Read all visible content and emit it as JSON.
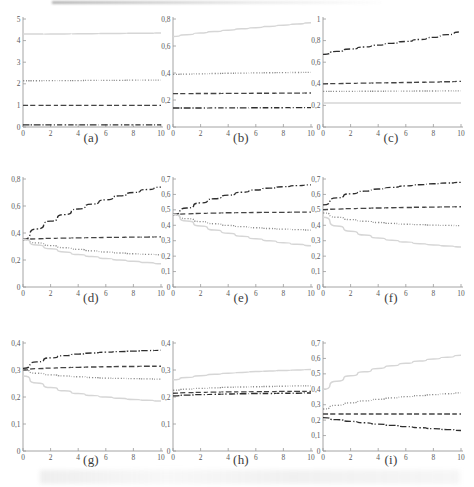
{
  "figure": {
    "title": "",
    "panel_count": 9,
    "layout": "3x3 grid of line plots",
    "decimal_separator": "comma"
  },
  "line_styles": {
    "solid": {
      "name": "solid",
      "color": "#d6d6d6",
      "dash": "none"
    },
    "dotted": {
      "name": "dotted",
      "color": "#8c8c8c",
      "dash": "1,1.6"
    },
    "dashed": {
      "name": "dashed",
      "color": "#444444",
      "dash": "5,2.6"
    },
    "dashdot": {
      "name": "dash-dot",
      "color": "#2e2e2e",
      "dash": "6,2,1.2,2"
    }
  },
  "chart_data": [
    {
      "type": "line",
      "panel": "(a)",
      "title": "",
      "xlabel": "",
      "ylabel": "",
      "xlim": [
        0,
        10
      ],
      "ylim": [
        0,
        5
      ],
      "xticks": [
        0,
        2,
        4,
        6,
        8,
        10
      ],
      "xticklabels": [
        "0",
        "2",
        "4",
        "6",
        "8",
        "10"
      ],
      "yticks": [
        0,
        1,
        2,
        3,
        4,
        5
      ],
      "yticklabels": [
        "0",
        "1",
        "2",
        "3",
        "4",
        "5"
      ],
      "grid": false,
      "legend": "none",
      "x": [
        0,
        1,
        2,
        3,
        4,
        5,
        6,
        7,
        8,
        9,
        10
      ],
      "series": [
        {
          "name": "solid",
          "style": "solid",
          "values": [
            4.3,
            4.3,
            4.31,
            4.31,
            4.32,
            4.32,
            4.33,
            4.33,
            4.34,
            4.34,
            4.35
          ]
        },
        {
          "name": "dotted",
          "style": "dotted",
          "values": [
            2.14,
            2.14,
            2.15,
            2.15,
            2.15,
            2.16,
            2.16,
            2.16,
            2.17,
            2.17,
            2.17
          ]
        },
        {
          "name": "dashed",
          "style": "dashed",
          "values": [
            1.0,
            1.0,
            1.0,
            1.0,
            1.0,
            1.0,
            1.0,
            1.0,
            1.0,
            1.0,
            1.0
          ]
        },
        {
          "name": "dashdot",
          "style": "dashdot",
          "values": [
            0.1,
            0.1,
            0.1,
            0.1,
            0.1,
            0.1,
            0.1,
            0.1,
            0.1,
            0.1,
            0.1
          ]
        }
      ]
    },
    {
      "type": "line",
      "panel": "(b)",
      "title": "",
      "xlabel": "",
      "ylabel": "",
      "xlim": [
        0,
        10
      ],
      "ylim": [
        0,
        0.8
      ],
      "xticks": [
        0,
        2,
        4,
        6,
        8,
        10
      ],
      "xticklabels": [
        "0",
        "2",
        "4",
        "6",
        "8",
        "10"
      ],
      "yticks": [
        0,
        0.2,
        0.4,
        0.6,
        0.8
      ],
      "yticklabels": [
        "0",
        "0,2",
        "0,4",
        "0,6",
        "0,8"
      ],
      "grid": false,
      "legend": "none",
      "x": [
        0,
        1,
        2,
        3,
        4,
        5,
        6,
        7,
        8,
        9,
        10
      ],
      "series": [
        {
          "name": "solid",
          "style": "solid",
          "values": [
            0.67,
            0.684,
            0.696,
            0.707,
            0.717,
            0.727,
            0.736,
            0.745,
            0.754,
            0.763,
            0.772
          ]
        },
        {
          "name": "dotted",
          "style": "dotted",
          "values": [
            0.39,
            0.392,
            0.394,
            0.396,
            0.398,
            0.399,
            0.401,
            0.402,
            0.403,
            0.404,
            0.405
          ]
        },
        {
          "name": "dashed",
          "style": "dashed",
          "values": [
            0.247,
            0.247,
            0.248,
            0.248,
            0.249,
            0.249,
            0.25,
            0.25,
            0.251,
            0.251,
            0.252
          ]
        },
        {
          "name": "dashdot",
          "style": "dashdot",
          "values": [
            0.141,
            0.141,
            0.141,
            0.142,
            0.142,
            0.142,
            0.143,
            0.143,
            0.143,
            0.144,
            0.144
          ]
        }
      ]
    },
    {
      "type": "line",
      "panel": "(c)",
      "title": "",
      "xlabel": "",
      "ylabel": "",
      "xlim": [
        0,
        10
      ],
      "ylim": [
        0,
        1
      ],
      "xticks": [
        0,
        2,
        4,
        6,
        8,
        10
      ],
      "xticklabels": [
        "0",
        "2",
        "4",
        "6",
        "8",
        "10"
      ],
      "yticks": [
        0,
        0.2,
        0.4,
        0.6,
        0.8,
        1
      ],
      "yticklabels": [
        "0",
        "0,2",
        "0,4",
        "0,6",
        "0,8",
        "1"
      ],
      "grid": false,
      "legend": "none",
      "x": [
        0,
        1,
        2,
        3,
        4,
        5,
        6,
        7,
        8,
        9,
        10
      ],
      "series": [
        {
          "name": "dashdot",
          "style": "dashdot",
          "values": [
            0.672,
            0.7,
            0.722,
            0.741,
            0.758,
            0.775,
            0.792,
            0.81,
            0.83,
            0.855,
            0.88
          ]
        },
        {
          "name": "dashed",
          "style": "dashed",
          "values": [
            0.4,
            0.402,
            0.404,
            0.406,
            0.408,
            0.41,
            0.412,
            0.414,
            0.416,
            0.419,
            0.422
          ]
        },
        {
          "name": "dotted",
          "style": "dotted",
          "values": [
            0.33,
            0.33,
            0.33,
            0.331,
            0.331,
            0.332,
            0.332,
            0.333,
            0.333,
            0.334,
            0.335
          ]
        },
        {
          "name": "solid",
          "style": "solid",
          "values": [
            0.222,
            0.222,
            0.222,
            0.222,
            0.222,
            0.222,
            0.222,
            0.222,
            0.222,
            0.222,
            0.222
          ]
        }
      ]
    },
    {
      "type": "line",
      "panel": "(d)",
      "title": "",
      "xlabel": "",
      "ylabel": "",
      "xlim": [
        0,
        10
      ],
      "ylim": [
        0,
        0.8
      ],
      "xticks": [
        0,
        2,
        4,
        6,
        8,
        10
      ],
      "xticklabels": [
        "0",
        "2",
        "4",
        "6",
        "8",
        "10"
      ],
      "yticks": [
        0,
        0.2,
        0.4,
        0.6,
        0.8
      ],
      "yticklabels": [
        "0",
        "0,2",
        "0,4",
        "0,6",
        "0,8"
      ],
      "grid": false,
      "legend": "none",
      "x": [
        0,
        1,
        2,
        3,
        4,
        5,
        6,
        7,
        8,
        9,
        10
      ],
      "series": [
        {
          "name": "dashdot",
          "style": "dashdot",
          "values": [
            0.352,
            0.43,
            0.488,
            0.536,
            0.578,
            0.614,
            0.646,
            0.675,
            0.7,
            0.722,
            0.74
          ]
        },
        {
          "name": "dashed",
          "style": "dashed",
          "values": [
            0.352,
            0.357,
            0.36,
            0.362,
            0.364,
            0.366,
            0.367,
            0.368,
            0.369,
            0.37,
            0.371
          ]
        },
        {
          "name": "dotted",
          "style": "dotted",
          "values": [
            0.352,
            0.327,
            0.307,
            0.291,
            0.279,
            0.268,
            0.259,
            0.252,
            0.246,
            0.242,
            0.239
          ]
        },
        {
          "name": "solid",
          "style": "solid",
          "values": [
            0.352,
            0.312,
            0.283,
            0.26,
            0.241,
            0.226,
            0.212,
            0.2,
            0.19,
            0.181,
            0.172
          ]
        }
      ]
    },
    {
      "type": "line",
      "panel": "(e)",
      "title": "",
      "xlabel": "",
      "ylabel": "",
      "xlim": [
        0,
        10
      ],
      "ylim": [
        0,
        0.7
      ],
      "xticks": [
        0,
        2,
        4,
        6,
        8,
        10
      ],
      "xticklabels": [
        "0",
        "2",
        "4",
        "6",
        "8",
        "10"
      ],
      "yticks": [
        0,
        0.1,
        0.2,
        0.3,
        0.4,
        0.5,
        0.6,
        0.7
      ],
      "yticklabels": [
        "0",
        "0,1",
        "0,2",
        "0,3",
        "0,4",
        "0,5",
        "0,6",
        "0,7"
      ],
      "grid": false,
      "legend": "none",
      "x": [
        0,
        1,
        2,
        3,
        4,
        5,
        6,
        7,
        8,
        9,
        10
      ],
      "series": [
        {
          "name": "dashdot",
          "style": "dashdot",
          "values": [
            0.47,
            0.512,
            0.545,
            0.572,
            0.595,
            0.614,
            0.629,
            0.641,
            0.65,
            0.657,
            0.662
          ]
        },
        {
          "name": "dashed",
          "style": "dashed",
          "values": [
            0.47,
            0.474,
            0.477,
            0.479,
            0.481,
            0.482,
            0.483,
            0.484,
            0.484,
            0.485,
            0.485
          ]
        },
        {
          "name": "dotted",
          "style": "dotted",
          "values": [
            0.47,
            0.443,
            0.424,
            0.41,
            0.399,
            0.391,
            0.384,
            0.379,
            0.375,
            0.372,
            0.369
          ]
        },
        {
          "name": "solid",
          "style": "solid",
          "values": [
            0.47,
            0.428,
            0.396,
            0.37,
            0.348,
            0.329,
            0.313,
            0.299,
            0.287,
            0.277,
            0.268
          ]
        }
      ]
    },
    {
      "type": "line",
      "panel": "(f)",
      "title": "",
      "xlabel": "",
      "ylabel": "",
      "xlim": [
        0,
        10
      ],
      "ylim": [
        0,
        0.7
      ],
      "xticks": [
        0,
        2,
        4,
        6,
        8,
        10
      ],
      "xticklabels": [
        "0",
        "2",
        "4",
        "6",
        "8",
        "10"
      ],
      "yticks": [
        0,
        0.1,
        0.2,
        0.3,
        0.4,
        0.5,
        0.6,
        0.7
      ],
      "yticklabels": [
        "0",
        "0,1",
        "0,2",
        "0,3",
        "0,4",
        "0,5",
        "0,6",
        "0,7"
      ],
      "grid": false,
      "legend": "none",
      "x": [
        0,
        1,
        2,
        3,
        4,
        5,
        6,
        7,
        8,
        9,
        10
      ],
      "series": [
        {
          "name": "dashdot",
          "style": "dashdot",
          "values": [
            0.532,
            0.578,
            0.604,
            0.621,
            0.635,
            0.646,
            0.655,
            0.663,
            0.669,
            0.674,
            0.678
          ]
        },
        {
          "name": "dashed",
          "style": "dashed",
          "values": [
            0.502,
            0.505,
            0.508,
            0.51,
            0.512,
            0.514,
            0.515,
            0.517,
            0.518,
            0.519,
            0.52
          ]
        },
        {
          "name": "dotted",
          "style": "dotted",
          "values": [
            0.48,
            0.452,
            0.437,
            0.426,
            0.418,
            0.412,
            0.407,
            0.404,
            0.401,
            0.399,
            0.398
          ]
        },
        {
          "name": "solid",
          "style": "solid",
          "values": [
            0.452,
            0.396,
            0.362,
            0.337,
            0.318,
            0.303,
            0.291,
            0.281,
            0.273,
            0.266,
            0.26
          ]
        }
      ]
    },
    {
      "type": "line",
      "panel": "(g)",
      "title": "",
      "xlabel": "",
      "ylabel": "",
      "xlim": [
        0,
        10
      ],
      "ylim": [
        0,
        0.4
      ],
      "xticks": [
        0,
        2,
        4,
        6,
        8,
        10
      ],
      "xticklabels": [
        "0",
        "2",
        "4",
        "6",
        "8",
        "10"
      ],
      "yticks": [
        0,
        0.1,
        0.2,
        0.3,
        0.4
      ],
      "yticklabels": [
        "0",
        "0,1",
        "0,2",
        "0,3",
        "0,4"
      ],
      "grid": false,
      "legend": "none",
      "x": [
        0,
        1,
        2,
        3,
        4,
        5,
        6,
        7,
        8,
        9,
        10
      ],
      "series": [
        {
          "name": "dashdot",
          "style": "dashdot",
          "values": [
            0.306,
            0.33,
            0.345,
            0.353,
            0.359,
            0.363,
            0.366,
            0.368,
            0.37,
            0.372,
            0.373
          ]
        },
        {
          "name": "dashed",
          "style": "dashed",
          "values": [
            0.3,
            0.305,
            0.307,
            0.309,
            0.31,
            0.311,
            0.312,
            0.313,
            0.313,
            0.314,
            0.314
          ]
        },
        {
          "name": "dotted",
          "style": "dotted",
          "values": [
            0.3,
            0.288,
            0.282,
            0.278,
            0.275,
            0.272,
            0.27,
            0.269,
            0.268,
            0.267,
            0.266
          ]
        },
        {
          "name": "solid",
          "style": "solid",
          "values": [
            0.278,
            0.252,
            0.235,
            0.223,
            0.213,
            0.206,
            0.2,
            0.195,
            0.191,
            0.188,
            0.185
          ]
        }
      ]
    },
    {
      "type": "line",
      "panel": "(h)",
      "title": "",
      "xlabel": "",
      "ylabel": "",
      "xlim": [
        0,
        10
      ],
      "ylim": [
        0,
        0.4
      ],
      "xticks": [
        0,
        2,
        4,
        6,
        8,
        10
      ],
      "xticklabels": [
        "0",
        "2",
        "4",
        "6",
        "8",
        "10"
      ],
      "yticks": [
        0,
        0.1,
        0.2,
        0.3,
        0.4
      ],
      "yticklabels": [
        "0",
        "0,1",
        "0,2",
        "0,3",
        "0,4"
      ],
      "grid": false,
      "legend": "none",
      "x": [
        0,
        1,
        2,
        3,
        4,
        5,
        6,
        7,
        8,
        9,
        10
      ],
      "series": [
        {
          "name": "solid",
          "style": "solid",
          "values": [
            0.264,
            0.272,
            0.279,
            0.284,
            0.288,
            0.291,
            0.294,
            0.296,
            0.298,
            0.3,
            0.302
          ]
        },
        {
          "name": "dotted",
          "style": "dotted",
          "values": [
            0.225,
            0.229,
            0.232,
            0.234,
            0.236,
            0.237,
            0.238,
            0.239,
            0.24,
            0.241,
            0.241
          ]
        },
        {
          "name": "dashed",
          "style": "dashed",
          "values": [
            0.214,
            0.216,
            0.217,
            0.218,
            0.219,
            0.219,
            0.22,
            0.22,
            0.221,
            0.221,
            0.221
          ]
        },
        {
          "name": "dashdot",
          "style": "dashdot",
          "values": [
            0.204,
            0.207,
            0.209,
            0.21,
            0.211,
            0.212,
            0.213,
            0.213,
            0.214,
            0.214,
            0.215
          ]
        }
      ]
    },
    {
      "type": "line",
      "panel": "(i)",
      "title": "",
      "xlabel": "",
      "ylabel": "",
      "xlim": [
        0,
        10
      ],
      "ylim": [
        0,
        0.7
      ],
      "xticks": [
        0,
        2,
        4,
        6,
        8,
        10
      ],
      "xticklabels": [
        "0",
        "2",
        "4",
        "6",
        "8",
        "10"
      ],
      "yticks": [
        0,
        0.1,
        0.2,
        0.3,
        0.4,
        0.5,
        0.6,
        0.7
      ],
      "yticklabels": [
        "0",
        "0,1",
        "0,2",
        "0,3",
        "0,4",
        "0,5",
        "0,6",
        "0,7"
      ],
      "grid": false,
      "legend": "none",
      "x": [
        0,
        1,
        2,
        3,
        4,
        5,
        6,
        7,
        8,
        9,
        10
      ],
      "series": [
        {
          "name": "solid",
          "style": "solid",
          "values": [
            0.4,
            0.452,
            0.487,
            0.513,
            0.535,
            0.553,
            0.569,
            0.583,
            0.596,
            0.608,
            0.62
          ]
        },
        {
          "name": "dotted",
          "style": "dotted",
          "values": [
            0.272,
            0.296,
            0.312,
            0.325,
            0.335,
            0.344,
            0.352,
            0.359,
            0.365,
            0.371,
            0.377
          ]
        },
        {
          "name": "dashed",
          "style": "dashed",
          "values": [
            0.24,
            0.24,
            0.24,
            0.24,
            0.24,
            0.24,
            0.24,
            0.24,
            0.24,
            0.24,
            0.24
          ]
        },
        {
          "name": "dashdot",
          "style": "dashdot",
          "values": [
            0.216,
            0.203,
            0.192,
            0.183,
            0.174,
            0.166,
            0.158,
            0.151,
            0.145,
            0.139,
            0.133
          ]
        }
      ]
    }
  ]
}
